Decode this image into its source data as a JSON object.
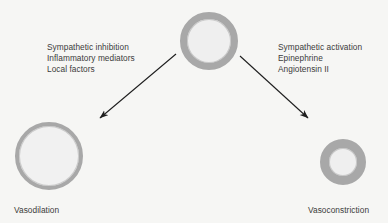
{
  "diagram": {
    "background_color": "#f6f6f4",
    "text_color": "#3b3b3b",
    "vessel_wall_color": "#a8a8a8",
    "vessel_lumen_color": "#efefef",
    "arrow_color": "#1e1e1e"
  },
  "center": {
    "vessel_name": "blood vessel cross-section (resting tone)"
  },
  "left_branch": {
    "factors": [
      "Sympathetic inhibition",
      "Inflammatory mediators",
      "Local factors"
    ],
    "outcome_label": "Vasodilation",
    "vessel_name": "dilated blood vessel cross-section"
  },
  "right_branch": {
    "factors": [
      "Sympathetic activation",
      "Epinephrine",
      "Angiotensin II"
    ],
    "outcome_label": "Vasoconstriction",
    "vessel_name": "constricted blood vessel cross-section"
  }
}
